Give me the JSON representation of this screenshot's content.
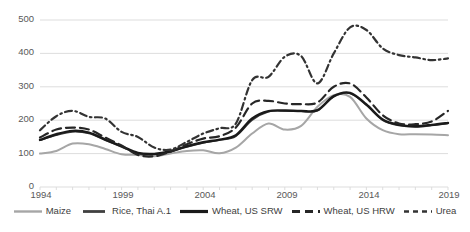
{
  "chart_data": {
    "type": "line",
    "title": "",
    "xlabel": "",
    "ylabel": "",
    "xlim": [
      1994,
      2019
    ],
    "ylim": [
      0,
      500
    ],
    "grid": true,
    "legend_position": "bottom",
    "x": [
      1994,
      1995,
      1996,
      1997,
      1998,
      1999,
      2000,
      2001,
      2002,
      2003,
      2004,
      2005,
      2006,
      2007,
      2008,
      2009,
      2010,
      2011,
      2012,
      2013,
      2014,
      2015,
      2016,
      2017,
      2018,
      2019
    ],
    "xticks": [
      "1994",
      "1999",
      "2004",
      "2009",
      "2014",
      "2019"
    ],
    "yticks": [
      "0",
      "100",
      "200",
      "300",
      "400",
      "500"
    ],
    "series": [
      {
        "name": "Maize",
        "color": "#A6A6A6",
        "style": "solid",
        "width": 2.0,
        "values": [
          100,
          108,
          130,
          128,
          114,
          98,
          96,
          92,
          100,
          108,
          110,
          101,
          118,
          160,
          190,
          172,
          183,
          240,
          275,
          270,
          205,
          170,
          158,
          158,
          157,
          155
        ]
      },
      {
        "name": "Rice, Thai A.1",
        "color": "#404040",
        "style": "solid",
        "width": 1.6,
        "values": [
          140,
          155,
          165,
          160,
          140,
          120,
          100,
          98,
          105,
          120,
          132,
          140,
          152,
          200,
          225,
          228,
          226,
          228,
          270,
          280,
          245,
          200,
          184,
          180,
          184,
          190
        ]
      },
      {
        "name": "Wheat, US SRW",
        "color": "#1A1A1A",
        "style": "solid",
        "width": 2.4,
        "values": [
          141,
          158,
          168,
          163,
          142,
          122,
          102,
          99,
          107,
          122,
          134,
          142,
          155,
          205,
          227,
          229,
          228,
          230,
          272,
          282,
          247,
          202,
          186,
          182,
          186,
          192
        ]
      },
      {
        "name": "Wheat, US HRW",
        "color": "#262626",
        "style": "dashed-long",
        "width": 2.2,
        "values": [
          148,
          172,
          178,
          172,
          148,
          124,
          96,
          92,
          106,
          128,
          145,
          152,
          178,
          250,
          258,
          250,
          248,
          253,
          300,
          310,
          268,
          215,
          190,
          188,
          196,
          228
        ]
      },
      {
        "name": "Urea",
        "color": "#333333",
        "style": "dash-dot",
        "width": 2.2,
        "values": [
          170,
          212,
          228,
          210,
          205,
          165,
          150,
          118,
          112,
          135,
          160,
          176,
          190,
          320,
          330,
          390,
          392,
          310,
          400,
          478,
          470,
          415,
          395,
          388,
          380,
          385
        ]
      }
    ]
  },
  "axes": {
    "y_labels": [
      "500",
      "400",
      "300",
      "200",
      "100",
      "0"
    ],
    "x_labels": [
      "1994",
      "1999",
      "2004",
      "2009",
      "2014",
      "2019"
    ]
  },
  "legend": {
    "items": [
      {
        "label": "Maize"
      },
      {
        "label": "Rice, Thai A.1"
      },
      {
        "label": "Wheat, US SRW"
      },
      {
        "label": "Wheat, US HRW"
      },
      {
        "label": "Urea"
      }
    ]
  }
}
